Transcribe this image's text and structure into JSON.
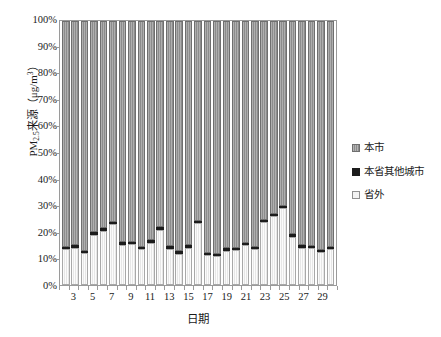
{
  "chart_data": {
    "type": "bar",
    "subtype": "stacked-percentage",
    "title": "",
    "xlabel": "日期",
    "ylabel": "PM2.5来源（μg/m³）",
    "ylabel_parts": {
      "prefix": "PM",
      "sub": "2.5",
      "mid": "来源（μg/m",
      "sup": "3",
      "suffix": "）"
    },
    "ylim": [
      0,
      100
    ],
    "ytick_labels": [
      "0%",
      "10%",
      "20%",
      "30%",
      "40%",
      "50%",
      "60%",
      "70%",
      "80%",
      "90%",
      "100%"
    ],
    "ytick_values": [
      0,
      10,
      20,
      30,
      40,
      50,
      60,
      70,
      80,
      90,
      100
    ],
    "grid": false,
    "legend_position": "right",
    "categories": [
      2,
      3,
      4,
      5,
      6,
      7,
      8,
      9,
      10,
      11,
      12,
      13,
      14,
      15,
      16,
      17,
      18,
      19,
      20,
      21,
      22,
      23,
      24,
      25,
      26,
      27,
      28,
      29,
      30
    ],
    "xtick_labels": [
      "3",
      "5",
      "7",
      "9",
      "11",
      "13",
      "15",
      "17",
      "19",
      "21",
      "23",
      "25",
      "27",
      "29"
    ],
    "xtick_categories": [
      3,
      5,
      7,
      9,
      11,
      13,
      15,
      17,
      19,
      21,
      23,
      25,
      27,
      29
    ],
    "series": [
      {
        "name": "省外",
        "color": "#e6e6e6",
        "values": [
          13.5,
          14.2,
          12.0,
          19.0,
          20.6,
          23.0,
          15.2,
          15.5,
          13.6,
          15.8,
          20.8,
          13.8,
          11.8,
          14.2,
          23.3,
          11.2,
          10.8,
          13.0,
          13.2,
          15.0,
          13.5,
          23.8,
          26.0,
          29.0,
          18.2,
          14.2,
          13.9,
          12.5,
          13.5
        ]
      },
      {
        "name": "本省其他城市",
        "color": "#1c1c1c",
        "values": [
          0.8,
          0.8,
          0.9,
          1.0,
          0.9,
          1.0,
          1.0,
          0.9,
          0.9,
          1.1,
          1.0,
          0.9,
          0.9,
          0.9,
          1.0,
          0.9,
          0.9,
          0.9,
          0.9,
          0.9,
          0.9,
          1.0,
          1.0,
          1.0,
          1.0,
          0.9,
          0.9,
          0.9,
          0.9
        ]
      },
      {
        "name": "本市",
        "color": "#8c8c8c",
        "values": [
          85.7,
          85.0,
          87.1,
          80.0,
          78.5,
          76.0,
          83.8,
          83.6,
          85.5,
          83.1,
          78.2,
          85.3,
          87.3,
          84.9,
          75.7,
          87.9,
          88.3,
          86.1,
          85.9,
          84.1,
          85.6,
          75.2,
          73.0,
          70.0,
          80.8,
          84.9,
          85.2,
          86.6,
          85.6
        ]
      }
    ]
  },
  "legend": {
    "items": [
      {
        "label": "本市",
        "swatch": "hatched-gray-swatch"
      },
      {
        "label": "本省其他城市",
        "swatch": "solid-black-swatch"
      },
      {
        "label": "省外",
        "swatch": "light-outline-swatch"
      }
    ]
  }
}
